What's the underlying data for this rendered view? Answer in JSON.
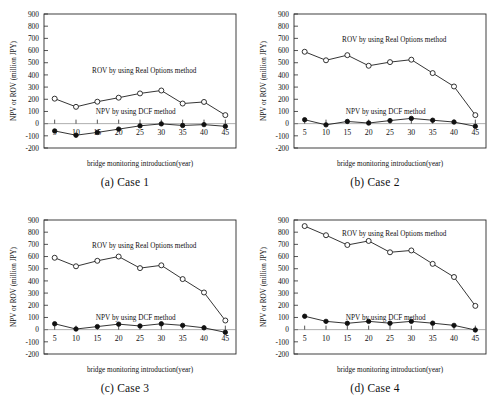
{
  "figure": {
    "title": "",
    "panel_count": 4
  },
  "axes": {
    "ylabel": "NPV or ROV (million JPY)",
    "xlabel": "bridge monitoring introduction(year)",
    "yticks": [
      900,
      800,
      700,
      600,
      500,
      400,
      300,
      200,
      100,
      0,
      -100,
      -200
    ],
    "ytick_labels": [
      "900",
      "800",
      "700",
      "600",
      "500",
      "400",
      "300",
      "200",
      "100",
      "0",
      "-100",
      "-200"
    ],
    "xticks": [
      5,
      10,
      15,
      20,
      25,
      30,
      35,
      40,
      45
    ],
    "xtick_labels": [
      "5",
      "10",
      "15",
      "20",
      "25",
      "30",
      "35",
      "40",
      "45"
    ],
    "ylim": [
      -200,
      900
    ],
    "xlim": [
      2.5,
      47.5
    ],
    "grid": false
  },
  "series_labels": {
    "rov": "ROV by using Real Options method",
    "npv": "NPV by using DCF method"
  },
  "colors": {
    "line": "#111111",
    "marker_open_fill": "#ffffff",
    "marker_filled_fill": "#111111",
    "axis": "#2a2a2a",
    "zeroline": "#8a8a8a",
    "background": "#ffffff"
  },
  "chart_data": [
    {
      "type": "line",
      "panel_id": "case-1",
      "caption": "(a) Case 1",
      "title": "",
      "xlabel": "bridge monitoring introduction(year)",
      "ylabel": "NPV or ROV (million JPY)",
      "x": [
        5,
        10,
        15,
        20,
        25,
        30,
        35,
        40,
        45
      ],
      "xlim": [
        2.5,
        47.5
      ],
      "ylim": [
        -200,
        900
      ],
      "series": [
        {
          "name": "ROV by using Real Options method",
          "marker": "open-circle",
          "values": [
            205,
            138,
            180,
            213,
            248,
            272,
            165,
            178,
            70
          ]
        },
        {
          "name": "NPV by using DCF method",
          "marker": "filled-circle",
          "values": [
            -60,
            -95,
            -72,
            -45,
            -18,
            -2,
            -15,
            -8,
            -22
          ]
        }
      ]
    },
    {
      "type": "line",
      "panel_id": "case-2",
      "caption": "(b) Case 2",
      "title": "",
      "xlabel": "bridge monitoring introduction(year)",
      "ylabel": "NPV or ROV (million JPY)",
      "x": [
        5,
        10,
        15,
        20,
        25,
        30,
        35,
        40,
        45
      ],
      "xlim": [
        2.5,
        47.5
      ],
      "ylim": [
        -200,
        900
      ],
      "series": [
        {
          "name": "ROV by using Real Options method",
          "marker": "open-circle",
          "values": [
            590,
            520,
            562,
            475,
            505,
            525,
            415,
            305,
            70
          ]
        },
        {
          "name": "NPV by using DCF method",
          "marker": "filled-circle",
          "values": [
            32,
            -10,
            18,
            5,
            25,
            43,
            28,
            13,
            -22
          ]
        }
      ]
    },
    {
      "type": "line",
      "panel_id": "case-3",
      "caption": "(c) Case 3",
      "title": "",
      "xlabel": "bridge monitoring introduction(year)",
      "ylabel": "NPV or ROV (million JPY)",
      "x": [
        5,
        10,
        15,
        20,
        25,
        30,
        35,
        40,
        45
      ],
      "xlim": [
        2.5,
        47.5
      ],
      "ylim": [
        -200,
        900
      ],
      "series": [
        {
          "name": "ROV by using Real Options method",
          "marker": "open-circle",
          "values": [
            590,
            520,
            565,
            600,
            505,
            528,
            415,
            305,
            75
          ]
        },
        {
          "name": "NPV by using DCF method",
          "marker": "filled-circle",
          "values": [
            48,
            5,
            25,
            45,
            30,
            48,
            35,
            15,
            -22
          ]
        }
      ]
    },
    {
      "type": "line",
      "panel_id": "case-4",
      "caption": "(d) Case 4",
      "title": "",
      "xlabel": "bridge monitoring introduction(year)",
      "ylabel": "NPV or ROV (million JPY)",
      "x": [
        5,
        10,
        15,
        20,
        25,
        30,
        35,
        40,
        45
      ],
      "xlim": [
        2.5,
        47.5
      ],
      "ylim": [
        -200,
        900
      ],
      "series": [
        {
          "name": "ROV by using Real Options method",
          "marker": "open-circle",
          "values": [
            850,
            775,
            695,
            728,
            635,
            650,
            540,
            432,
            195
          ]
        },
        {
          "name": "NPV by using DCF method",
          "marker": "filled-circle",
          "values": [
            110,
            68,
            52,
            68,
            53,
            68,
            53,
            35,
            -3
          ]
        }
      ]
    }
  ]
}
